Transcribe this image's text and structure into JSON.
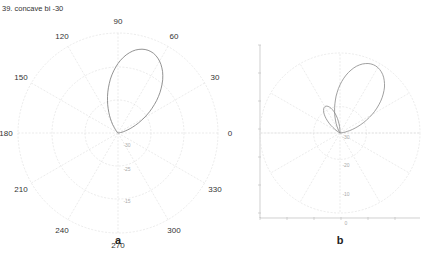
{
  "title": "39. concave bi -30",
  "chart_data": [
    {
      "type": "polar",
      "panel": "a",
      "title": "",
      "angular_ticks": [
        "0",
        "30",
        "60",
        "90",
        "120",
        "150",
        "180",
        "210",
        "240",
        "270",
        "300",
        "330"
      ],
      "radial_ticks": [
        "-30",
        "-25",
        "-15"
      ],
      "grid": true,
      "series": [
        {
          "name": "radiation pattern",
          "description": "single teardrop main lobe pointing ~70°",
          "peak_angle_deg": 70,
          "peak_relative_radius": 0.88
        }
      ]
    },
    {
      "type": "polar",
      "panel": "b",
      "title": "",
      "angular_ticks": [],
      "radial_ticks": [
        "-30",
        "-20",
        "-10",
        "0"
      ],
      "grid": true,
      "series": [
        {
          "name": "radiation pattern",
          "description": "main lobe pointing ~65° with small side lobe at ~110°",
          "peak_angle_deg": 65,
          "peak_relative_radius": 0.92,
          "side_lobe_angle_deg": 112,
          "side_lobe_relative_radius": 0.38
        }
      ]
    }
  ],
  "panels": {
    "a": {
      "label": "a",
      "angles": [
        {
          "deg": 0,
          "label": "0"
        },
        {
          "deg": 30,
          "label": "30"
        },
        {
          "deg": 60,
          "label": "60"
        },
        {
          "deg": 90,
          "label": "90"
        },
        {
          "deg": 120,
          "label": "120"
        },
        {
          "deg": 150,
          "label": "150"
        },
        {
          "deg": 180,
          "label": "180"
        },
        {
          "deg": 210,
          "label": "210"
        },
        {
          "deg": 240,
          "label": "240"
        },
        {
          "deg": 270,
          "label": "270"
        },
        {
          "deg": 300,
          "label": "300"
        },
        {
          "deg": 330,
          "label": "330"
        }
      ],
      "radial_labels": [
        "-30",
        "-25",
        "-15"
      ]
    },
    "b": {
      "label": "b",
      "radial_labels": [
        "-30",
        "-20",
        "-10",
        "0"
      ]
    }
  }
}
